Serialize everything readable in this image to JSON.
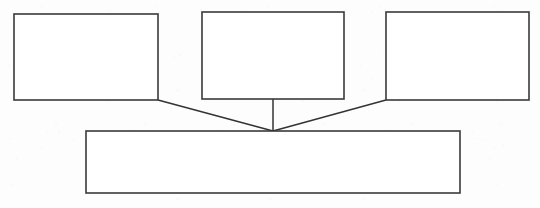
{
  "diagram": {
    "title": "",
    "type": "hierarchy-flowchart",
    "background_color": "#fdfdfd",
    "stroke_color": "#3a3a3a",
    "fill_color": "#ffffff",
    "canvas": {
      "width": 540,
      "height": 208
    },
    "nodes": [
      {
        "id": "top-box-left",
        "label": "",
        "x": 14,
        "y": 14,
        "width": 144,
        "height": 86
      },
      {
        "id": "top-box-center",
        "label": "",
        "x": 202,
        "y": 12,
        "width": 142,
        "height": 87
      },
      {
        "id": "top-box-right",
        "label": "",
        "x": 386,
        "y": 12,
        "width": 143,
        "height": 88
      },
      {
        "id": "bottom-box",
        "label": "",
        "x": 86,
        "y": 131,
        "width": 374,
        "height": 62
      }
    ],
    "junction": {
      "x": 273,
      "y": 131
    },
    "connectors": [
      {
        "id": "connector-left",
        "from": "top-box-left",
        "to": "bottom-box",
        "x1": 158,
        "y1": 100,
        "x2": 273,
        "y2": 131
      },
      {
        "id": "connector-center",
        "from": "top-box-center",
        "to": "bottom-box",
        "x1": 273,
        "y1": 99,
        "x2": 273,
        "y2": 131
      },
      {
        "id": "connector-right",
        "from": "top-box-right",
        "to": "bottom-box",
        "x1": 386,
        "y1": 100,
        "x2": 273,
        "y2": 131
      }
    ]
  }
}
